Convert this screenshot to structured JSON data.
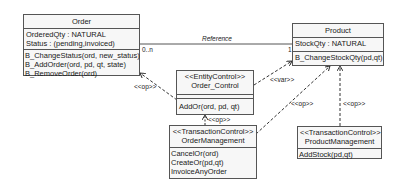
{
  "classes": {
    "order": {
      "name": "Order",
      "attributes": [
        "OrderedQty : NATURAL",
        "Status : (pending,invoiced)"
      ],
      "methods": [
        "B_ChangeStatus(ord, new_status)",
        "B_AddOrder(ord, pd, qt, state)",
        "B_RemoveOrder(ord)"
      ]
    },
    "product": {
      "name": "Product",
      "attributes": [
        "StockQty : NATURAL"
      ],
      "methods": [
        "B_ChangeStockQty(pd,qt)"
      ]
    },
    "order_control": {
      "stereotype": "<<EntityControl>>",
      "name": "Order_Control",
      "attributes": [],
      "methods": [
        "AddOr(ord, pd, qt)"
      ]
    },
    "order_management": {
      "stereotype": "<<TransactionControl>>",
      "name": "OrderManagement",
      "methods": [
        "CancelOr(ord)",
        "CreateOr(pd,qt)",
        "InvoiceAnyOrder"
      ]
    },
    "product_management": {
      "stereotype": "<<TransactionControl>>",
      "name": "ProductManagement",
      "methods": [
        "AddStock(pd,qt)"
      ]
    }
  },
  "associations": {
    "reference": {
      "label": "Reference",
      "source_multiplicity": "0..n",
      "target_multiplicity": "1"
    }
  },
  "dependencies": {
    "control_to_order": "<<op>>",
    "control_to_product": "<<var>>",
    "ordermgmt_to_control": "<<op>>",
    "ordermgmt_to_product": "<<op>>",
    "productmgmt_to_product": "<<op>>"
  },
  "colors": {
    "box_fill": "#f7f7f7",
    "border": "#555555",
    "line": "#333333"
  }
}
